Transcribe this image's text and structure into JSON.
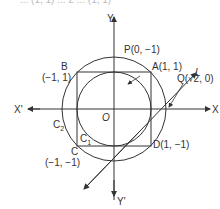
{
  "figure": {
    "type": "coordinate geometry diagram",
    "top_cropped_text": "... (1, 1) ... 2 ... (1, 1)",
    "axes": {
      "x_positive": "X",
      "x_negative": "X'",
      "y_positive": "Y",
      "y_negative": "Y'",
      "origin": "O"
    },
    "points": {
      "A": {
        "label": "A(1, 1)"
      },
      "B": {
        "label": "B",
        "coords": "(−1, 1)"
      },
      "C": {
        "label": "C",
        "coords": "(−1, −1)"
      },
      "D": {
        "label": "D(1, −1)"
      },
      "P": {
        "label": "P(0, −1)"
      },
      "Q": {
        "label": "Q(√2, 0)"
      },
      "L": {
        "label": "L"
      }
    },
    "curves": {
      "C1": {
        "label": "C",
        "sub": "1",
        "desc": "inner circle x²+y²=1"
      },
      "C2": {
        "label": "C",
        "sub": "2",
        "desc": "outer circle x²+y²=2"
      }
    },
    "colors": {
      "line": "#333333",
      "background": "#ffffff"
    }
  }
}
